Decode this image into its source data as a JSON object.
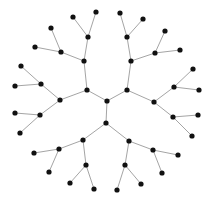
{
  "diagram": {
    "type": "radial-tree",
    "width": 212,
    "height": 201,
    "colors": {
      "background": "#ffffff",
      "edge": "#9a9a9a",
      "node": "#111111"
    },
    "node_radius": 2.6,
    "nodes": [
      {
        "id": "root",
        "x": 107,
        "y": 101
      },
      {
        "id": "a",
        "x": 87,
        "y": 90
      },
      {
        "id": "a1",
        "x": 84,
        "y": 61
      },
      {
        "id": "a1a",
        "x": 88,
        "y": 37
      },
      {
        "id": "a1a1",
        "x": 73,
        "y": 17
      },
      {
        "id": "a1a2",
        "x": 96,
        "y": 12
      },
      {
        "id": "a1b",
        "x": 61,
        "y": 52
      },
      {
        "id": "a1b1",
        "x": 51,
        "y": 28
      },
      {
        "id": "a1b2",
        "x": 35,
        "y": 47
      },
      {
        "id": "a2",
        "x": 60,
        "y": 100
      },
      {
        "id": "a2a",
        "x": 41,
        "y": 84
      },
      {
        "id": "a2a1",
        "x": 21,
        "y": 66
      },
      {
        "id": "a2a2",
        "x": 15,
        "y": 86
      },
      {
        "id": "a2b",
        "x": 40,
        "y": 115
      },
      {
        "id": "a2b1",
        "x": 15,
        "y": 113
      },
      {
        "id": "a2b2",
        "x": 20,
        "y": 133
      },
      {
        "id": "b",
        "x": 127,
        "y": 90
      },
      {
        "id": "b1",
        "x": 131,
        "y": 61
      },
      {
        "id": "b1a",
        "x": 127,
        "y": 37
      },
      {
        "id": "b1a1",
        "x": 120,
        "y": 13
      },
      {
        "id": "b1a2",
        "x": 143,
        "y": 19
      },
      {
        "id": "b1b",
        "x": 155,
        "y": 53
      },
      {
        "id": "b1b1",
        "x": 165,
        "y": 31
      },
      {
        "id": "b1b2",
        "x": 180,
        "y": 50
      },
      {
        "id": "b2",
        "x": 154,
        "y": 102
      },
      {
        "id": "b2a",
        "x": 174,
        "y": 87
      },
      {
        "id": "b2a1",
        "x": 193,
        "y": 69
      },
      {
        "id": "b2a2",
        "x": 199,
        "y": 90
      },
      {
        "id": "b2b",
        "x": 173,
        "y": 117
      },
      {
        "id": "b2b1",
        "x": 198,
        "y": 115
      },
      {
        "id": "b2b2",
        "x": 192,
        "y": 136
      },
      {
        "id": "c",
        "x": 106,
        "y": 123
      },
      {
        "id": "c1",
        "x": 83,
        "y": 140
      },
      {
        "id": "c1a",
        "x": 59,
        "y": 149
      },
      {
        "id": "c1a1",
        "x": 34,
        "y": 153
      },
      {
        "id": "c1a2",
        "x": 49,
        "y": 172
      },
      {
        "id": "c1b",
        "x": 86,
        "y": 165
      },
      {
        "id": "c1b1",
        "x": 70,
        "y": 183
      },
      {
        "id": "c1b2",
        "x": 94,
        "y": 189
      },
      {
        "id": "c2",
        "x": 129,
        "y": 141
      },
      {
        "id": "c2a",
        "x": 153,
        "y": 150
      },
      {
        "id": "c2a1",
        "x": 178,
        "y": 155
      },
      {
        "id": "c2a2",
        "x": 162,
        "y": 173
      },
      {
        "id": "c2b",
        "x": 125,
        "y": 165
      },
      {
        "id": "c2b1",
        "x": 141,
        "y": 184
      },
      {
        "id": "c2b2",
        "x": 117,
        "y": 190
      }
    ],
    "edges": [
      [
        "root",
        "a"
      ],
      [
        "root",
        "b"
      ],
      [
        "root",
        "c"
      ],
      [
        "a",
        "a1"
      ],
      [
        "a",
        "a2"
      ],
      [
        "a1",
        "a1a"
      ],
      [
        "a1",
        "a1b"
      ],
      [
        "a1a",
        "a1a1"
      ],
      [
        "a1a",
        "a1a2"
      ],
      [
        "a1b",
        "a1b1"
      ],
      [
        "a1b",
        "a1b2"
      ],
      [
        "a2",
        "a2a"
      ],
      [
        "a2",
        "a2b"
      ],
      [
        "a2a",
        "a2a1"
      ],
      [
        "a2a",
        "a2a2"
      ],
      [
        "a2b",
        "a2b1"
      ],
      [
        "a2b",
        "a2b2"
      ],
      [
        "b",
        "b1"
      ],
      [
        "b",
        "b2"
      ],
      [
        "b1",
        "b1a"
      ],
      [
        "b1",
        "b1b"
      ],
      [
        "b1a",
        "b1a1"
      ],
      [
        "b1a",
        "b1a2"
      ],
      [
        "b1b",
        "b1b1"
      ],
      [
        "b1b",
        "b1b2"
      ],
      [
        "b2",
        "b2a"
      ],
      [
        "b2",
        "b2b"
      ],
      [
        "b2a",
        "b2a1"
      ],
      [
        "b2a",
        "b2a2"
      ],
      [
        "b2b",
        "b2b1"
      ],
      [
        "b2b",
        "b2b2"
      ],
      [
        "c",
        "c1"
      ],
      [
        "c",
        "c2"
      ],
      [
        "c1",
        "c1a"
      ],
      [
        "c1",
        "c1b"
      ],
      [
        "c1a",
        "c1a1"
      ],
      [
        "c1a",
        "c1a2"
      ],
      [
        "c1b",
        "c1b1"
      ],
      [
        "c1b",
        "c1b2"
      ],
      [
        "c2",
        "c2a"
      ],
      [
        "c2",
        "c2b"
      ],
      [
        "c2a",
        "c2a1"
      ],
      [
        "c2a",
        "c2a2"
      ],
      [
        "c2b",
        "c2b1"
      ],
      [
        "c2b",
        "c2b2"
      ]
    ]
  }
}
